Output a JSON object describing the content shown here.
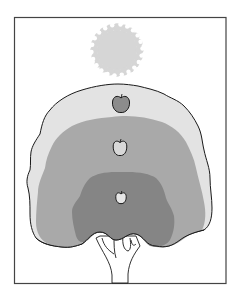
{
  "illustration": {
    "subject": "tree canopy with light zones",
    "colors": {
      "background": "#ffffff",
      "frame": "#444444",
      "sun": "#d6d6d6",
      "outer_zone": "#e3e3e3",
      "middle_zone": "#a9a9a9",
      "inner_zone": "#858585",
      "outline": "#1a1a1a",
      "apple_top": "#8c8c8c",
      "apple_middle": "#d8d8d8",
      "apple_bottom": "#e6e6e6"
    },
    "elements": [
      {
        "name": "sun",
        "icon": "sun-icon"
      },
      {
        "name": "outer-canopy-zone",
        "shade": "light"
      },
      {
        "name": "middle-canopy-zone",
        "shade": "medium"
      },
      {
        "name": "inner-canopy-zone",
        "shade": "dark"
      },
      {
        "name": "apple-top",
        "icon": "apple-icon"
      },
      {
        "name": "apple-middle",
        "icon": "apple-icon"
      },
      {
        "name": "apple-bottom",
        "icon": "apple-icon"
      },
      {
        "name": "tree-trunk"
      }
    ]
  }
}
